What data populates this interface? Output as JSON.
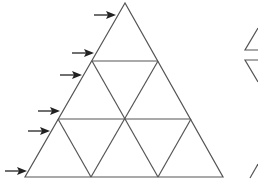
{
  "diagram": {
    "line_color": "#555555",
    "arrow_color": "#222222",
    "big_triangle": {
      "apex": [
        125,
        3
      ],
      "bottom_left": [
        25,
        177
      ],
      "bottom_right": [
        223,
        177
      ]
    },
    "subdivisions": 3,
    "arrows": [
      {
        "y": 15,
        "x1": 94,
        "x2": 116
      },
      {
        "y": 53,
        "x1": 72,
        "x2": 94
      },
      {
        "y": 75,
        "x1": 60,
        "x2": 82
      },
      {
        "y": 111,
        "x1": 38,
        "x2": 60
      },
      {
        "y": 131,
        "x1": 28,
        "x2": 50
      },
      {
        "y": 171,
        "x1": 5,
        "x2": 27
      }
    ],
    "partial_shapes_right": [
      "triangle-top-partial",
      "triangle-inverted-partial",
      "triangle-bottom-partial"
    ]
  }
}
